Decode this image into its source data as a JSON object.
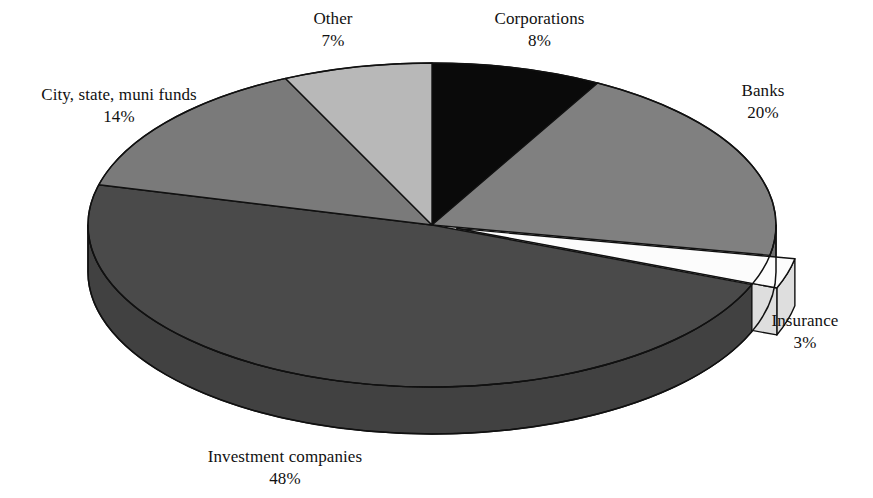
{
  "chart_data": {
    "type": "pie",
    "title": "",
    "subtitle": "",
    "xlabel": "",
    "ylabel": "",
    "legend_position": "none",
    "grid": false,
    "style": "3d-exploded-grayscale",
    "value_unit": "%",
    "categories": [
      "Corporations",
      "Banks",
      "Insurance",
      "Investment companies",
      "City, state, muni funds",
      "Other"
    ],
    "values": [
      8,
      20,
      3,
      48,
      14,
      7
    ],
    "labels": [
      "8%",
      "20%",
      "3%",
      "48%",
      "14%",
      "7%"
    ],
    "colors": [
      "#0a0a0a",
      "#808080",
      "#fcfcfc",
      "#4a4a4a",
      "#7a7a7a",
      "#b8b8b8"
    ],
    "slices": [
      {
        "name": "Corporations",
        "value": 8,
        "value_label": "8%",
        "color": "#0a0a0a",
        "exploded": false
      },
      {
        "name": "Banks",
        "value": 20,
        "value_label": "20%",
        "color": "#808080",
        "exploded": false
      },
      {
        "name": "Insurance",
        "value": 3,
        "value_label": "3%",
        "color": "#fcfcfc",
        "exploded": true
      },
      {
        "name": "Investment companies",
        "value": 48,
        "value_label": "48%",
        "color": "#4a4a4a",
        "exploded": false
      },
      {
        "name": "City, state, muni funds",
        "value": 14,
        "value_label": "14%",
        "color": "#7a7a7a",
        "exploded": false
      },
      {
        "name": "Other",
        "value": 7,
        "value_label": "7%",
        "color": "#b8b8b8",
        "exploded": false
      }
    ]
  },
  "labels": {
    "other": {
      "name": "Other",
      "value": "7%"
    },
    "corporations": {
      "name": "Corporations",
      "value": "8%"
    },
    "banks": {
      "name": "Banks",
      "value": "20%"
    },
    "insurance": {
      "name": "Insurance",
      "value": "3%"
    },
    "investment": {
      "name": "Investment companies",
      "value": "48%"
    },
    "city": {
      "name": "City, state, muni funds",
      "value": "14%"
    }
  },
  "theme": {
    "background": "#ffffff",
    "outline": "#111111",
    "text": "#111111"
  }
}
